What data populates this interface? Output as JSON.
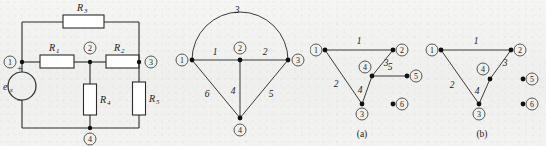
{
  "figure": {
    "background_color": "#f2f2f0",
    "ink_color": "#1a1a1a",
    "panels": [
      "circuit",
      "graph",
      "subgraph-a",
      "subgraph-b"
    ]
  },
  "circuit": {
    "name": "resistive-circuit",
    "source": {
      "label": "e",
      "subscript": "s",
      "plus": "+",
      "minus": "−"
    },
    "resistors": [
      {
        "id": "R1",
        "label": "R",
        "subscript": "1",
        "orientation": "horizontal"
      },
      {
        "id": "R2",
        "label": "R",
        "subscript": "2",
        "orientation": "horizontal"
      },
      {
        "id": "R3",
        "label": "R",
        "subscript": "3",
        "orientation": "horizontal"
      },
      {
        "id": "R4",
        "label": "R",
        "subscript": "4",
        "orientation": "vertical"
      },
      {
        "id": "R5",
        "label": "R",
        "subscript": "5",
        "orientation": "vertical"
      }
    ],
    "nodes": [
      "1",
      "2",
      "3",
      "4"
    ]
  },
  "graph": {
    "name": "circuit-graph",
    "nodes": [
      "1",
      "2",
      "3",
      "4"
    ],
    "edges": [
      {
        "label": "1",
        "from": "1",
        "to": "2",
        "style": "straight"
      },
      {
        "label": "2",
        "from": "2",
        "to": "3",
        "style": "straight"
      },
      {
        "label": "3",
        "from": "1",
        "to": "3",
        "style": "arc"
      },
      {
        "label": "4",
        "from": "2",
        "to": "4",
        "style": "straight"
      },
      {
        "label": "5",
        "from": "3",
        "to": "4",
        "style": "straight"
      },
      {
        "label": "6",
        "from": "1",
        "to": "4",
        "style": "straight"
      }
    ]
  },
  "subgraph_a": {
    "name": "subgraph-a",
    "caption": "(a)",
    "nodes": [
      "1",
      "2",
      "3",
      "4",
      "5",
      "6"
    ],
    "isolated_nodes": [
      "6"
    ],
    "edges": [
      {
        "label": "1",
        "from": "1",
        "to": "2"
      },
      {
        "label": "2",
        "from": "1",
        "to": "3"
      },
      {
        "label": "3",
        "from": "2",
        "to": "4"
      },
      {
        "label": "4",
        "from": "4",
        "to": "3"
      },
      {
        "label": "5",
        "from": "4",
        "to": "5"
      }
    ]
  },
  "subgraph_b": {
    "name": "subgraph-b",
    "caption": "(b)",
    "nodes": [
      "1",
      "2",
      "3",
      "4",
      "5",
      "6"
    ],
    "isolated_nodes": [
      "5",
      "6"
    ],
    "edges": [
      {
        "label": "1",
        "from": "1",
        "to": "2"
      },
      {
        "label": "2",
        "from": "1",
        "to": "3"
      },
      {
        "label": "3",
        "from": "2",
        "to": "4"
      },
      {
        "label": "4",
        "from": "4",
        "to": "3"
      }
    ]
  }
}
